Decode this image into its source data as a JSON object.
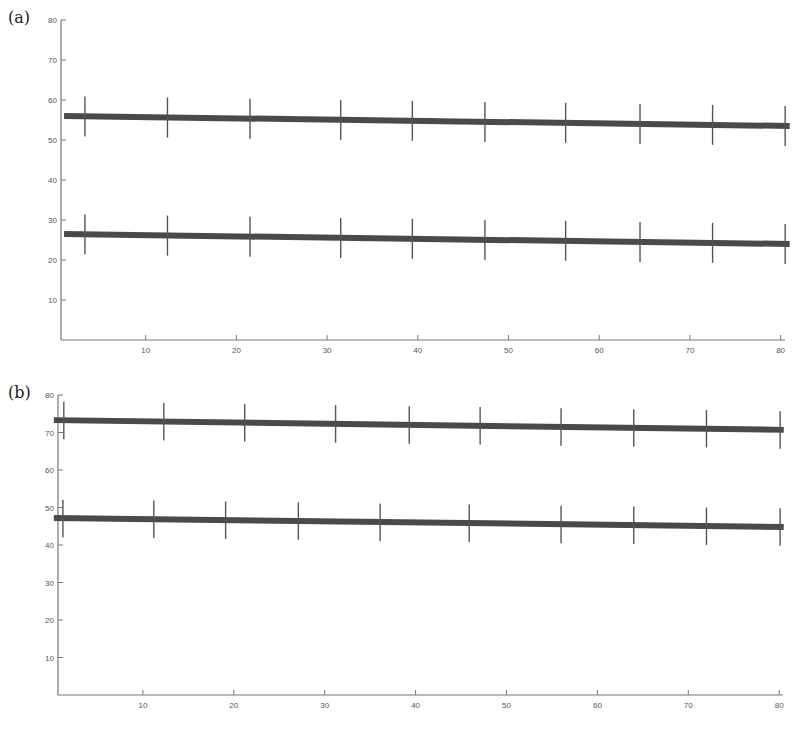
{
  "chart_data": [
    {
      "panel_label": "(a)",
      "type": "line",
      "title": "",
      "xlabel": "",
      "ylabel": "",
      "xlim": [
        0,
        81
      ],
      "ylim": [
        0,
        80
      ],
      "x_ticks": [
        10,
        20,
        30,
        40,
        50,
        60,
        70,
        80
      ],
      "y_ticks": [
        10,
        20,
        30,
        40,
        50,
        60,
        70,
        80
      ],
      "grid": false,
      "legend": null,
      "series": [
        {
          "name": "upper",
          "line_x": [
            1,
            81
          ],
          "line_y": [
            56.0,
            53.5
          ],
          "errorbars": {
            "x": [
              3.3,
              12.4,
              21.5,
              31.5,
              39.4,
              47.4,
              56.3,
              64.5,
              72.5,
              80.5
            ],
            "y": [
              55.9,
              55.6,
              55.3,
              55.0,
              54.8,
              54.5,
              54.3,
              54.0,
              53.8,
              53.5
            ],
            "err": 5
          }
        },
        {
          "name": "lower",
          "line_x": [
            1,
            81
          ],
          "line_y": [
            26.5,
            24.0
          ],
          "errorbars": {
            "x": [
              3.3,
              12.4,
              21.5,
              31.5,
              39.4,
              47.4,
              56.3,
              64.5,
              72.5,
              80.5
            ],
            "y": [
              26.4,
              26.1,
              25.8,
              25.5,
              25.3,
              25.0,
              24.8,
              24.5,
              24.3,
              24.0
            ],
            "err": 5
          }
        }
      ]
    },
    {
      "panel_label": "(b)",
      "type": "line",
      "title": "",
      "xlabel": "",
      "ylabel": "",
      "xlim": [
        0,
        81
      ],
      "ylim": [
        0,
        80
      ],
      "x_ticks": [
        10,
        20,
        30,
        40,
        50,
        60,
        70,
        80
      ],
      "y_ticks": [
        10,
        20,
        30,
        40,
        50,
        60,
        70,
        80
      ],
      "grid": false,
      "legend": null,
      "series": [
        {
          "name": "upper",
          "line_x": [
            0.2,
            80.5
          ],
          "line_y": [
            73.3,
            70.7
          ],
          "errorbars": {
            "x": [
              1.3,
              12.3,
              21.2,
              31.2,
              39.3,
              47.1,
              56.0,
              64.0,
              72.0,
              80.1
            ],
            "y": [
              73.2,
              72.9,
              72.6,
              72.3,
              72.0,
              71.8,
              71.5,
              71.2,
              71.0,
              70.7
            ],
            "err": 5
          }
        },
        {
          "name": "lower",
          "line_x": [
            0.2,
            80.5
          ],
          "line_y": [
            47.2,
            44.8
          ],
          "errorbars": {
            "x": [
              1.2,
              11.2,
              19.1,
              27.1,
              36.1,
              45.9,
              56.0,
              64.0,
              72.0,
              80.1
            ],
            "y": [
              47.1,
              46.9,
              46.6,
              46.4,
              46.1,
              45.8,
              45.5,
              45.3,
              45.0,
              44.8
            ],
            "err": 5
          }
        }
      ]
    }
  ],
  "style": {
    "line_color": "#4a4a4a",
    "errorbar_color": "#555555",
    "axis_color": "#777777",
    "label_color": "#555555"
  }
}
